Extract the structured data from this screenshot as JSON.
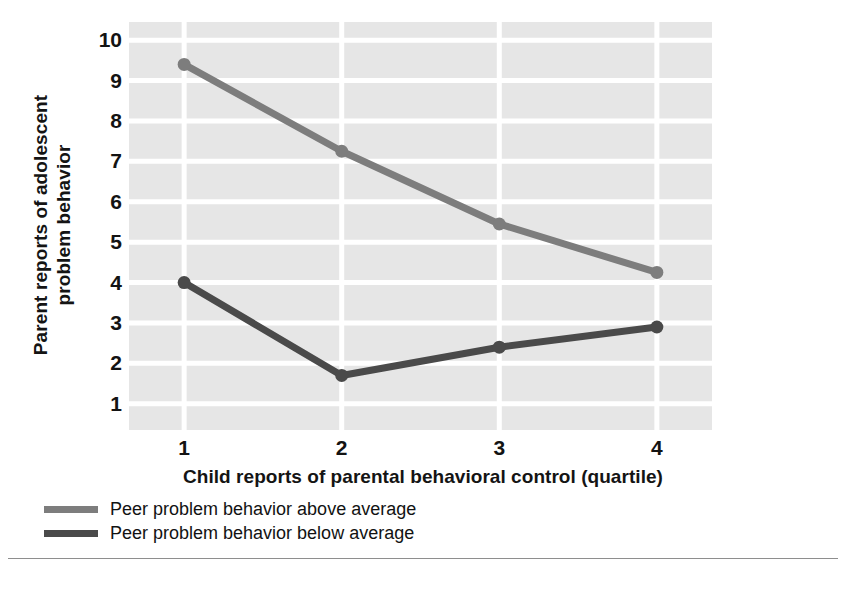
{
  "chart_data": {
    "type": "line",
    "title": "",
    "xlabel": "Child reports of parental behavioral control (quartile)",
    "ylabel": "Parent reports of adolescent problem behavior",
    "ylabel_line1": "Parent reports of adolescent",
    "ylabel_line2": "problem behavior",
    "categories": [
      "1",
      "2",
      "3",
      "4"
    ],
    "x": [
      1,
      2,
      3,
      4
    ],
    "xlim": [
      0.65,
      4.35
    ],
    "ylim": [
      0.35,
      10.45
    ],
    "yticks": [
      "10",
      "9",
      "8",
      "7",
      "6",
      "5",
      "4",
      "3",
      "2",
      "1"
    ],
    "ytick_values": [
      10,
      9,
      8,
      7,
      6,
      5,
      4,
      3,
      2,
      1
    ],
    "xticks": [
      "1",
      "2",
      "3",
      "4"
    ],
    "grid": true,
    "grid_color": "#ffffff",
    "plot_background": "#e6e6e6",
    "legend_position": "below-axes-left",
    "series": [
      {
        "name": "Peer problem behavior above average",
        "values": [
          9.4,
          7.25,
          5.45,
          4.25
        ],
        "color": "#7d7d7d",
        "marker": "circle"
      },
      {
        "name": "Peer problem behavior below average",
        "values": [
          4.0,
          1.7,
          2.4,
          2.9
        ],
        "color": "#4a4a4a",
        "marker": "circle"
      }
    ]
  },
  "legend": {
    "items": [
      {
        "label": "Peer problem behavior above average",
        "color": "#7d7d7d"
      },
      {
        "label": "Peer problem behavior below average",
        "color": "#4a4a4a"
      }
    ]
  },
  "axes": {
    "y_title_line1": "Parent reports of adolescent",
    "y_title_line2": "problem behavior",
    "x_title": "Child reports of parental behavioral control (quartile)"
  }
}
